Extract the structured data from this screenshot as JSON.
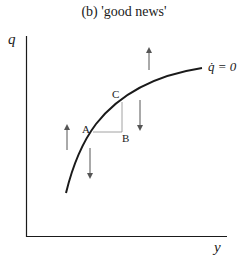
{
  "title": "(b) 'good news'",
  "axes": {
    "y_label": "q",
    "x_label": "y"
  },
  "curve_label": "q̇ = 0",
  "points": {
    "A": "A",
    "B": "B",
    "C": "C"
  },
  "colors": {
    "ink": "#1a1a1a",
    "guide": "#8a8a8a"
  }
}
